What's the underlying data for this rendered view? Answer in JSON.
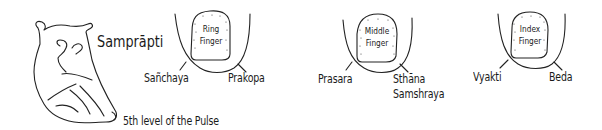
{
  "diagram": {
    "title": "Samprāpti",
    "caption": "5th level of the Pulse",
    "heart_icon": "heart-outline-drawing",
    "fingers": [
      {
        "name": "Ring",
        "label_line1": "Ring",
        "label_line2": "Finger",
        "left_stage": "Sañchaya",
        "right_stage": "Prakopa"
      },
      {
        "name": "Middle",
        "label_line1": "Middle",
        "label_line2": "Finger",
        "left_stage": "Prasara",
        "right_stage_line1": "Sthāna",
        "right_stage_line2": "Samshraya"
      },
      {
        "name": "Index",
        "label_line1": "Index",
        "label_line2": "Finger",
        "left_stage": "Vyakti",
        "right_stage": "Beda"
      }
    ]
  }
}
